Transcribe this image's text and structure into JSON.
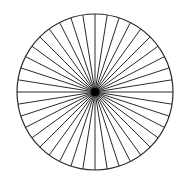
{
  "figure": {
    "type": "radial-line-pattern",
    "center": [
      95,
      92
    ],
    "radius": 78,
    "spoke_count": 40,
    "spoke_angle_step_deg": 9,
    "stroke_color": "#2a2a2a",
    "background_color": "#ffffff",
    "circle_stroke_width": 1.2,
    "spoke_stroke_width": 1.0
  }
}
